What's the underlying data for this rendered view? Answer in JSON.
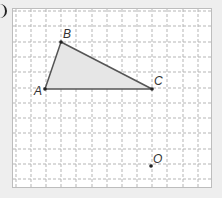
{
  "figure": {
    "type": "grid-geometry",
    "grid": {
      "columns_x": [
        16,
        31,
        46,
        61,
        76,
        92,
        107,
        122,
        137,
        152,
        167,
        183,
        198
      ],
      "rows_y": [
        11,
        26,
        42,
        57,
        72,
        88,
        103,
        118,
        133,
        149,
        164,
        179
      ],
      "line_color": "#b5b5b5",
      "style": "dashed"
    },
    "triangle": {
      "fill": "#e6e6e6",
      "stroke": "#555555",
      "vertices": [
        {
          "name": "A",
          "x": 45,
          "y": 89,
          "label_dx": -11,
          "label_dy": 6
        },
        {
          "name": "B",
          "x": 61,
          "y": 42,
          "label_dx": 2,
          "label_dy": -4
        },
        {
          "name": "C",
          "x": 152,
          "y": 89,
          "label_dx": 2,
          "label_dy": -4
        }
      ]
    },
    "points": [
      {
        "name": "O",
        "x": 151,
        "y": 166,
        "label_dx": 2,
        "label_dy": -3
      }
    ],
    "labels": {
      "A": "A",
      "B": "B",
      "C": "C",
      "O": "O"
    }
  }
}
